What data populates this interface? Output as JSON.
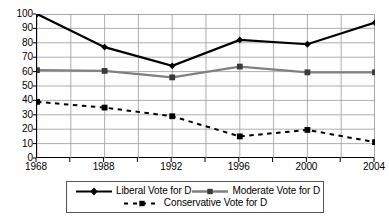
{
  "chart_data": {
    "type": "line",
    "title": "",
    "subtitle": "",
    "xlabel": "",
    "ylabel": "",
    "x": [
      1968,
      1988,
      1992,
      1996,
      2000,
      2004
    ],
    "categories": [
      "1968",
      "1988",
      "1992",
      "1996",
      "2000",
      "2004"
    ],
    "ylim": [
      0,
      100
    ],
    "ytick_labels": [
      "0",
      "10",
      "20",
      "30",
      "40",
      "50",
      "60",
      "70",
      "80",
      "90",
      "100"
    ],
    "ytick_values": [
      0,
      10,
      20,
      30,
      40,
      50,
      60,
      70,
      80,
      90,
      100
    ],
    "grid": true,
    "grid_axis": "both",
    "minor_vertical_gridlines": true,
    "legend_position": "bottom",
    "series": [
      {
        "name": "Liberal Vote for D",
        "values": [
          100,
          77,
          64,
          82,
          79,
          94
        ],
        "color": "#000000",
        "line_style": "solid",
        "line_width": 2.2,
        "marker": "diamond"
      },
      {
        "name": "Moderate Vote for D",
        "values": [
          61,
          60.5,
          56,
          63.5,
          59.5,
          59.5
        ],
        "color": "#808080",
        "line_style": "solid",
        "line_width": 2.2,
        "marker": "square"
      },
      {
        "name": "Conservative Vote for D",
        "values": [
          39,
          35,
          29,
          15,
          19.5,
          11
        ],
        "color": "#000000",
        "line_style": "dashed",
        "line_width": 2.0,
        "marker": "square"
      }
    ]
  },
  "legend": {
    "items": [
      {
        "label": "Liberal Vote for D"
      },
      {
        "label": "Moderate Vote for D"
      },
      {
        "label": "Conservative Vote for D"
      }
    ]
  },
  "colors": {
    "axis": "#000000",
    "grid": "#9a9a9a",
    "liberal": "#000000",
    "moderate": "#808080",
    "conservative": "#000000",
    "legend_border": "#555555",
    "background": "#ffffff"
  }
}
